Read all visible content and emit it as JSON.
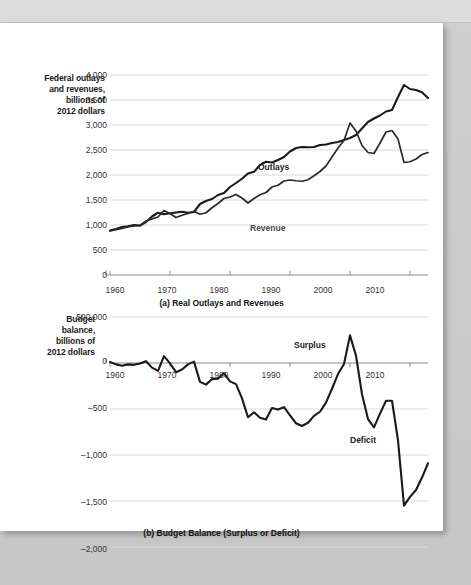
{
  "figure": {
    "panels": [
      {
        "id": "panel-a",
        "caption": "(a) Real Outlays and Revenues",
        "axis_title": [
          "Federal outlays",
          "and revenues,",
          "billions of",
          "2012 dollars"
        ],
        "y_ticks": [
          "4,000",
          "3,500",
          "3,000",
          "2,500",
          "2,000",
          "1,500",
          "1,000",
          "500",
          "0"
        ],
        "x_ticks": [
          "1960",
          "1970",
          "1980",
          "1990",
          "2000",
          "2010"
        ],
        "annotations": [
          {
            "name": "outlays-label",
            "text": "Outlays"
          },
          {
            "name": "revenue-label",
            "text": "Revenue"
          }
        ]
      },
      {
        "id": "panel-b",
        "caption": "(b) Budget Balance (Surplus or Deficit)",
        "axis_title": [
          "Budget",
          "balance,",
          "billions of",
          "2012 dollars"
        ],
        "y_ticks": [
          "500,000",
          "0",
          "–500",
          "–1,000",
          "–1,500",
          "–2,000"
        ],
        "x_ticks": [
          "1960",
          "1970",
          "1980",
          "1990",
          "2000",
          "2010"
        ],
        "annotations": [
          {
            "name": "surplus-label",
            "text": "Surplus"
          },
          {
            "name": "deficit-label",
            "text": "Deficit"
          }
        ]
      }
    ],
    "colors": {
      "line": "#1a1a1a",
      "grid": "#d8d8d8",
      "axis": "#8a8a8a",
      "page": "#ffffff",
      "backdrop": "#c8c8c8"
    }
  },
  "chart_data": [
    {
      "type": "line",
      "title": "(a) Real Outlays and Revenues",
      "xlabel": "",
      "ylabel": "Federal outlays and revenues, billions of 2012 dollars",
      "xlim": [
        1960,
        2013
      ],
      "ylim": [
        0,
        4000
      ],
      "ytick_values": [
        0,
        500,
        1000,
        1500,
        2000,
        2500,
        3000,
        3500,
        4000
      ],
      "xtick_values": [
        1960,
        1970,
        1980,
        1990,
        2000,
        2010
      ],
      "grid": true,
      "legend": "inline-labels",
      "x": [
        1960,
        1961,
        1962,
        1963,
        1964,
        1965,
        1966,
        1967,
        1968,
        1969,
        1970,
        1971,
        1972,
        1973,
        1974,
        1975,
        1976,
        1977,
        1978,
        1979,
        1980,
        1981,
        1982,
        1983,
        1984,
        1985,
        1986,
        1987,
        1988,
        1989,
        1990,
        1991,
        1992,
        1993,
        1994,
        1995,
        1996,
        1997,
        1998,
        1999,
        2000,
        2001,
        2002,
        2003,
        2004,
        2005,
        2006,
        2007,
        2008,
        2009,
        2010,
        2011,
        2012,
        2013
      ],
      "series": [
        {
          "name": "Outlays",
          "values": [
            890,
            920,
            960,
            975,
            1000,
            990,
            1060,
            1170,
            1245,
            1215,
            1235,
            1250,
            1265,
            1245,
            1260,
            1420,
            1480,
            1520,
            1600,
            1640,
            1760,
            1840,
            1925,
            2030,
            2065,
            2200,
            2265,
            2250,
            2300,
            2360,
            2470,
            2540,
            2560,
            2555,
            2560,
            2600,
            2610,
            2640,
            2660,
            2700,
            2740,
            2800,
            2930,
            3060,
            3130,
            3190,
            3270,
            3300,
            3560,
            3800,
            3720,
            3700,
            3655,
            3540
          ]
        },
        {
          "name": "Revenue",
          "values": [
            880,
            905,
            930,
            960,
            980,
            985,
            1080,
            1120,
            1160,
            1290,
            1230,
            1150,
            1195,
            1230,
            1275,
            1215,
            1245,
            1345,
            1430,
            1530,
            1560,
            1610,
            1540,
            1440,
            1530,
            1605,
            1650,
            1760,
            1795,
            1880,
            1900,
            1885,
            1875,
            1905,
            1985,
            2070,
            2180,
            2360,
            2540,
            2690,
            3040,
            2880,
            2590,
            2450,
            2430,
            2640,
            2860,
            2890,
            2720,
            2250,
            2265,
            2320,
            2410,
            2450
          ]
        }
      ]
    },
    {
      "type": "line",
      "title": "(b) Budget Balance (Surplus or Deficit)",
      "xlabel": "",
      "ylabel": "Budget balance, billions of 2012 dollars",
      "xlim": [
        1960,
        2013
      ],
      "ylim": [
        -2000,
        500
      ],
      "ytick_values": [
        500,
        0,
        -500,
        -1000,
        -1500,
        -2000
      ],
      "xtick_values": [
        1960,
        1970,
        1980,
        1990,
        2000,
        2010
      ],
      "grid": true,
      "annotations": [
        "Surplus",
        "Deficit"
      ],
      "x": [
        1960,
        1961,
        1962,
        1963,
        1964,
        1965,
        1966,
        1967,
        1968,
        1969,
        1970,
        1971,
        1972,
        1973,
        1974,
        1975,
        1976,
        1977,
        1978,
        1979,
        1980,
        1981,
        1982,
        1983,
        1984,
        1985,
        1986,
        1987,
        1988,
        1989,
        1990,
        1991,
        1992,
        1993,
        1994,
        1995,
        1996,
        1997,
        1998,
        1999,
        2000,
        2001,
        2002,
        2003,
        2004,
        2005,
        2006,
        2007,
        2008,
        2009,
        2010,
        2011,
        2012,
        2013
      ],
      "series": [
        {
          "name": "Budget balance",
          "values": [
            10,
            -15,
            -30,
            -15,
            -20,
            -5,
            20,
            -50,
            -85,
            75,
            -5,
            -100,
            -70,
            -15,
            15,
            -205,
            -235,
            -175,
            -170,
            -110,
            -200,
            -230,
            -385,
            -590,
            -535,
            -595,
            -615,
            -490,
            -505,
            -480,
            -570,
            -655,
            -685,
            -650,
            -575,
            -530,
            -430,
            -280,
            -120,
            -10,
            300,
            80,
            -340,
            -610,
            -700,
            -550,
            -410,
            -410,
            -840,
            -1550,
            -1455,
            -1380,
            -1245,
            -1090
          ]
        }
      ]
    }
  ]
}
